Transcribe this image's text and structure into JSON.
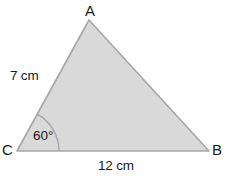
{
  "figure": {
    "kind": "triangle-diagram",
    "background_color": "#ffffff",
    "fill_color": "#d9d9d9",
    "stroke_color": "#a6a6a6",
    "arc_color": "#a6a6a6",
    "text_color": "#1a1a1a",
    "vertices": {
      "A": {
        "label": "A",
        "x": 89,
        "y": 20
      },
      "B": {
        "label": "B",
        "x": 209,
        "y": 151
      },
      "C": {
        "label": "C",
        "x": 17,
        "y": 151
      }
    },
    "sides": [
      {
        "name": "CA",
        "label": "7 cm",
        "value": 7,
        "unit": "cm"
      },
      {
        "name": "CB",
        "label": "12 cm",
        "value": 12,
        "unit": "cm"
      }
    ],
    "angles": [
      {
        "at": "C",
        "label": "60°",
        "value": 60,
        "unit": "degrees",
        "arc_radius": 42
      }
    ]
  }
}
